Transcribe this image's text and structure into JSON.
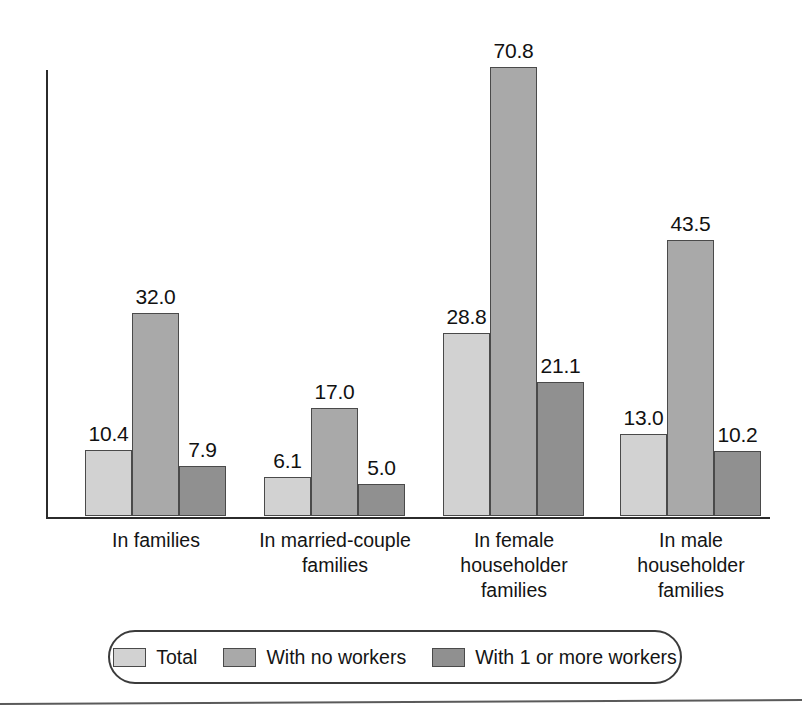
{
  "chart_data": {
    "type": "bar",
    "title": "",
    "subtitle": "",
    "xlabel": "",
    "ylabel": "",
    "ylim": [
      0,
      70.8
    ],
    "grid": false,
    "legend_position": "bottom",
    "categories": [
      "In families",
      "In married-couple\nfamilies",
      "In female\nhouseholder\nfamilies",
      "In male\nhouseholder\nfamilies"
    ],
    "series": [
      {
        "name": "Total",
        "color": "#d2d2d2",
        "values": [
          10.4,
          6.1,
          28.8,
          13.0
        ]
      },
      {
        "name": "With no workers",
        "color": "#a9a9a9",
        "values": [
          32.0,
          17.0,
          70.8,
          43.5
        ]
      },
      {
        "name": "With 1 or more workers",
        "color": "#909090",
        "values": [
          7.9,
          5.0,
          21.1,
          10.2
        ]
      }
    ],
    "data_labels": [
      [
        "10.4",
        "32.0",
        "7.9"
      ],
      [
        "6.1",
        "17.0",
        "5.0"
      ],
      [
        "28.8",
        "70.8",
        "21.1"
      ],
      [
        "13.0",
        "43.5",
        "10.2"
      ]
    ]
  },
  "legend": {
    "items": [
      {
        "label": "Total",
        "color": "#d2d2d2"
      },
      {
        "label": "With no workers",
        "color": "#a9a9a9"
      },
      {
        "label": "With 1 or more workers",
        "color": "#909090"
      }
    ]
  },
  "axis": {
    "line_color": "#2b2b2b"
  }
}
